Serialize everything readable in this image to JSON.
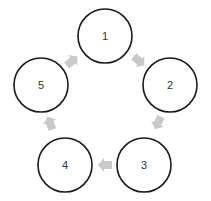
{
  "diagram": {
    "type": "cycle",
    "nodes": [
      {
        "id": "1",
        "label": "1",
        "cx": 105,
        "cy": 36,
        "r": 27
      },
      {
        "id": "2",
        "label": "2",
        "cx": 170,
        "cy": 85,
        "r": 27
      },
      {
        "id": "3",
        "label": "3",
        "cx": 144,
        "cy": 165,
        "r": 27
      },
      {
        "id": "4",
        "label": "4",
        "cx": 65,
        "cy": 165,
        "r": 27
      },
      {
        "id": "5",
        "label": "5",
        "cx": 41,
        "cy": 85,
        "r": 27
      }
    ],
    "edges": [
      {
        "from": "1",
        "to": "2",
        "x": 139,
        "y": 61,
        "angle": 40
      },
      {
        "from": "2",
        "to": "3",
        "x": 158,
        "y": 123,
        "angle": 115
      },
      {
        "from": "3",
        "to": "4",
        "x": 105,
        "y": 165,
        "angle": 180
      },
      {
        "from": "4",
        "to": "5",
        "x": 50,
        "y": 123,
        "angle": 250
      },
      {
        "from": "5",
        "to": "1",
        "x": 72,
        "y": 61,
        "angle": 320
      }
    ],
    "colors": {
      "circle_stroke": "#1a1a1a",
      "arrow_fill": "#c9c9c9",
      "label": "#333333",
      "background": "#ffffff"
    }
  }
}
